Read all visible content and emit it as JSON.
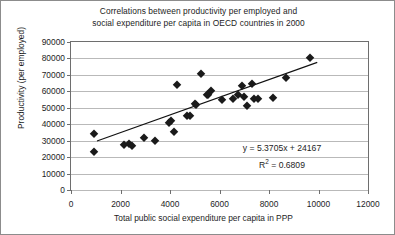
{
  "chart_data": {
    "type": "scatter",
    "title": "Correlations between productivity per employed and social expenditure per capita in OECD countries in 2000",
    "title_line1": "Correlations between productivity per employed and",
    "title_line2": "social expenditure per capita in OECD countries in 2000",
    "xlabel": "Total public social expenditure per capita in PPP",
    "ylabel": "Productivity (per employed)",
    "xlim": [
      0,
      12000
    ],
    "ylim": [
      0,
      90000
    ],
    "xticks": [
      0,
      2000,
      4000,
      6000,
      8000,
      10000,
      12000
    ],
    "yticks": [
      0,
      10000,
      20000,
      30000,
      40000,
      50000,
      60000,
      70000,
      80000,
      90000
    ],
    "grid": "horizontal",
    "legend": "none",
    "marker": "diamond",
    "marker_color": "#1a1a1a",
    "points": [
      {
        "x": 930,
        "y": 34000
      },
      {
        "x": 930,
        "y": 23000
      },
      {
        "x": 2150,
        "y": 27500
      },
      {
        "x": 2330,
        "y": 27800
      },
      {
        "x": 2480,
        "y": 27000
      },
      {
        "x": 2950,
        "y": 31500
      },
      {
        "x": 3400,
        "y": 30000
      },
      {
        "x": 3950,
        "y": 41000
      },
      {
        "x": 4050,
        "y": 42000
      },
      {
        "x": 4150,
        "y": 35000
      },
      {
        "x": 4300,
        "y": 64000
      },
      {
        "x": 4700,
        "y": 45000
      },
      {
        "x": 4800,
        "y": 45000
      },
      {
        "x": 5000,
        "y": 52500
      },
      {
        "x": 5050,
        "y": 51500
      },
      {
        "x": 5250,
        "y": 70500
      },
      {
        "x": 5500,
        "y": 58000
      },
      {
        "x": 5550,
        "y": 57500
      },
      {
        "x": 5650,
        "y": 60000
      },
      {
        "x": 6100,
        "y": 55000
      },
      {
        "x": 6550,
        "y": 55500
      },
      {
        "x": 6750,
        "y": 57500
      },
      {
        "x": 6900,
        "y": 63500
      },
      {
        "x": 7000,
        "y": 56500
      },
      {
        "x": 7100,
        "y": 51000
      },
      {
        "x": 7300,
        "y": 64500
      },
      {
        "x": 7400,
        "y": 55500
      },
      {
        "x": 7550,
        "y": 55500
      },
      {
        "x": 8150,
        "y": 56000
      },
      {
        "x": 8700,
        "y": 68000
      },
      {
        "x": 9650,
        "y": 80500
      }
    ],
    "trendline": {
      "equation": "y = 5.3705x + 24167",
      "r2_label": "R",
      "r2_exponent": "2",
      "r2_value": " = 0.6809",
      "slope": 5.3705,
      "intercept": 24167,
      "r2": 0.6809,
      "x_start": 1050,
      "x_end": 9950
    }
  }
}
